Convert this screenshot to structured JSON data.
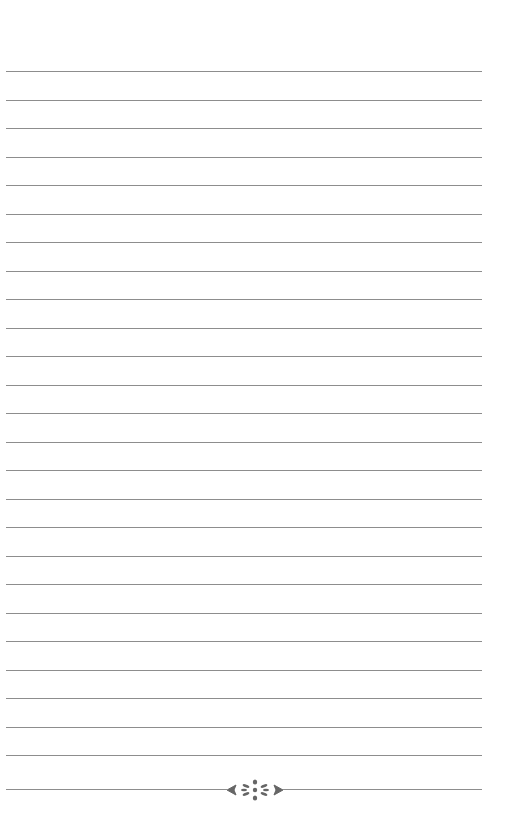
{
  "page": {
    "type": "lined-notebook-page",
    "line_color": "#8d8d8d",
    "background": "#ffffff",
    "line_count": 25,
    "first_line_y": 71,
    "line_spacing": 28.5,
    "line_left": 6,
    "line_right": 482
  },
  "footer": {
    "ornament": "flourish-divider-icon",
    "ornament_y": 789,
    "ornament_color": "#666666"
  }
}
